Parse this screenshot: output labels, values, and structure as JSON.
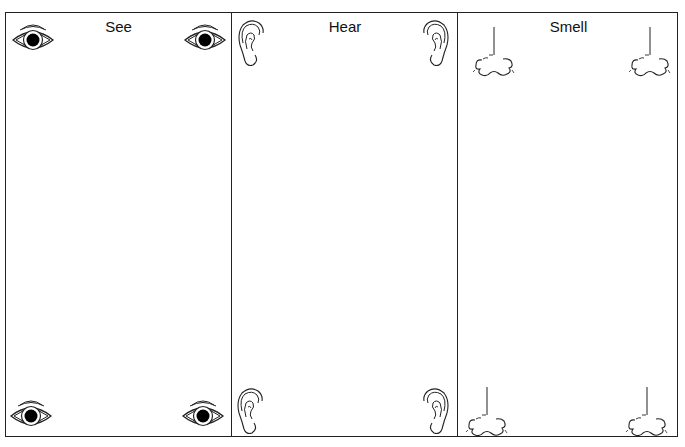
{
  "worksheet": {
    "columns": [
      {
        "title": "See",
        "icon": "eye-icon"
      },
      {
        "title": "Hear",
        "icon": "ear-icon"
      },
      {
        "title": "Smell",
        "icon": "nose-icon"
      }
    ]
  },
  "colors": {
    "line": "#222222",
    "background": "#ffffff"
  }
}
